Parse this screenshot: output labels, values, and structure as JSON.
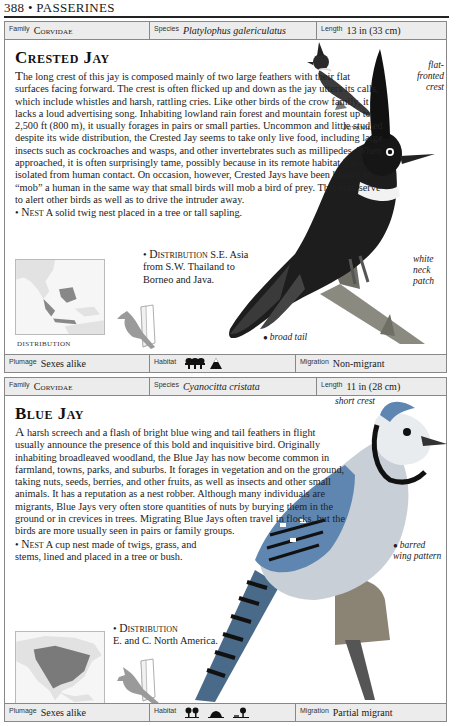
{
  "page": {
    "number": "388",
    "separator": "•",
    "section": "PASSERINES",
    "header": "388 • PASSERINES"
  },
  "entries": [
    {
      "id": "crested-jay",
      "family_label": "Family",
      "family": "Corvidae",
      "species_label": "Species",
      "species": "Platylophus galericulatus",
      "length_label": "Length",
      "length": "13 in (33 cm)",
      "title": "Crested Jay",
      "description_dropcap": "T",
      "description": "he long crest of this jay is composed mainly of two large feathers with their flat surfaces facing forward. The crest is often flicked up and down as the jay utters its calls, which include whistles and harsh, rattling cries. Like other birds of the crow family, it lacks a loud advertising song. Inhabiting lowland rain forest and mountain forest up to 2,500 ft (800 m), it usually forages in pairs or small parties. Uncommon and little studied despite its wide distribution, the Crested Jay seems to take only live food, including large insects such as cockroaches and wasps, and other invertebrates such as millipedes. When approached, it is often surprisingly tame, possibly because in its remote habitat it is isolated from human contact. On occasion, however, Crested Jays have been known to “mob” a human in the same way that small birds will mob a bird of prey. This may serve to alert other birds as well as to drive the intruder away.",
      "nest_label": "Nest",
      "nest": "A solid twig nest placed in a tree or tall sapling.",
      "distribution_label": "Distribution",
      "distribution": "S.E. Asia from S.W. Thailand to Borneo and Java.",
      "map_caption": "DISTRIBUTION",
      "annotations": [
        {
          "text": "flat-fronted crest"
        },
        {
          "text": "white neck patch"
        },
        {
          "text": "broad tail"
        }
      ],
      "juvenile_label": "Juvenile",
      "plumage_label": "Plumage",
      "plumage": "Sexes alike",
      "habitat_label": "Habitat",
      "habitat_icons": [
        "rainforest-icon",
        "mountain-icon"
      ],
      "migration_label": "Migration",
      "migration": "Non-migrant"
    },
    {
      "id": "blue-jay",
      "family_label": "Family",
      "family": "Corvidae",
      "species_label": "Species",
      "species": "Cyanocitta cristata",
      "length_label": "Length",
      "length": "11 in (28 cm)",
      "title": "Blue Jay",
      "description_dropcap": "A",
      "description": " harsh screech and a flash of bright blue wing and tail feathers in flight usually announce the presence of this bold and inquisitive bird. Originally inhabiting broadleaved woodland, the Blue Jay has now become common in farmland, towns, parks, and suburbs. It forages in vegetation and on the ground, taking nuts, seeds, berries, and other fruits, as well as insects and other small animals. It has a reputation as a nest robber. Although many individuals are migrants, Blue Jays very often store quantities of nuts by burying them in the ground or in crevices in trees. Migrating Blue Jays often travel in flocks, but the birds are more usually seen in pairs or family groups.",
      "nest_label": "Nest",
      "nest": "A cup nest made of twigs, grass, and stems, lined and placed in a tree or bush.",
      "distribution_label": "Distribution",
      "distribution": "E. and C. North America.",
      "map_caption": "DISTRIBUTION",
      "annotations": [
        {
          "text": "short crest"
        },
        {
          "text": "barred wing pattern"
        }
      ],
      "plumage_label": "Plumage",
      "plumage": "Sexes alike",
      "habitat_label": "Habitat",
      "habitat_icons": [
        "deciduous-forest-icon",
        "grassland-icon",
        "urban-icon"
      ],
      "migration_label": "Migration",
      "migration": "Partial migrant"
    }
  ]
}
